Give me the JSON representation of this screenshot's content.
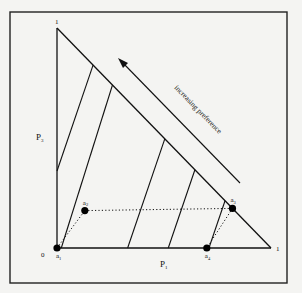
{
  "diagram": {
    "type": "probability-simplex",
    "vertex_labels": {
      "top": "1",
      "origin": "0",
      "right": "1"
    },
    "axis_labels": {
      "vertical": "P",
      "vertical_sub": "3",
      "horizontal": "P",
      "horizontal_sub": "1"
    },
    "arrow_label": "increasing preference",
    "points": [
      {
        "id": "a1",
        "label": "a",
        "sub": "1",
        "p1": 0.0,
        "p3": 0.0
      },
      {
        "id": "a2",
        "label": "a",
        "sub": "2",
        "p1": 0.13,
        "p3": 0.17
      },
      {
        "id": "a3",
        "label": "a",
        "sub": "3",
        "p1": 0.82,
        "p3": 0.18
      },
      {
        "id": "a4",
        "label": "a",
        "sub": "4",
        "p1": 0.7,
        "p3": 0.0
      }
    ],
    "indifference_curves": 5,
    "colors": {
      "ink": "#111111",
      "paper": "#f4f4f2"
    }
  }
}
